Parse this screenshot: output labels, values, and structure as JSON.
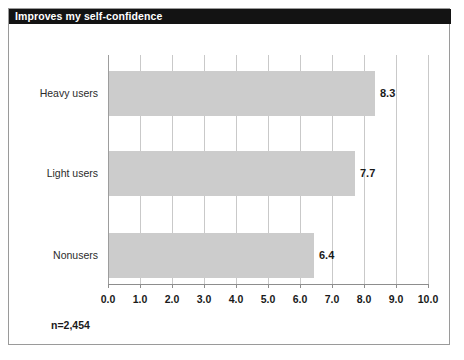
{
  "title": "Improves my self-confidence",
  "footnote": "n=2,454",
  "colors": {
    "title_bar_bg": "#131313",
    "title_text": "#ffffff",
    "bar_fill": "#cccccc",
    "gridline": "#c9c9c9",
    "axis": "#8d8d8d",
    "border": "#9a9a9a",
    "text": "#1a1a1a"
  },
  "chart_data": {
    "type": "bar",
    "orientation": "horizontal",
    "title": "Improves my self-confidence",
    "xlabel": "",
    "ylabel": "",
    "xlim": [
      0.0,
      10.0
    ],
    "grid": true,
    "legend": false,
    "categories": [
      "Heavy users",
      "Light users",
      "Nonusers"
    ],
    "values": [
      8.3,
      7.7,
      6.4
    ],
    "value_labels": [
      "8.3",
      "7.7",
      "6.4"
    ],
    "xticks": [
      0.0,
      1.0,
      2.0,
      3.0,
      4.0,
      5.0,
      6.0,
      7.0,
      8.0,
      9.0,
      10.0
    ],
    "xtick_labels": [
      "0.0",
      "1.0",
      "2.0",
      "3.0",
      "4.0",
      "5.0",
      "6.0",
      "7.0",
      "8.0",
      "9.0",
      "10.0"
    ],
    "annotation": "n=2,454"
  }
}
